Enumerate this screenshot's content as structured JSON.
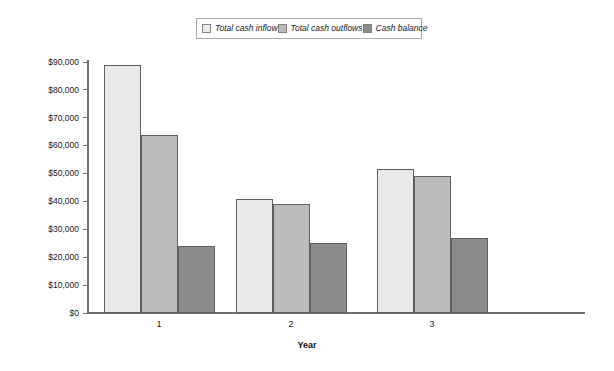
{
  "chart_data": {
    "type": "bar",
    "title": "",
    "subtitle": "",
    "xlabel": "Year",
    "ylabel": "",
    "categories": [
      "1",
      "2",
      "3"
    ],
    "series": [
      {
        "name": "Total cash inflow",
        "color": "#e9e9e9",
        "values": [
          89000,
          41000,
          51500
        ]
      },
      {
        "name": "Total cash outflows",
        "color": "#bcbcbc",
        "values": [
          64000,
          39000,
          49000
        ]
      },
      {
        "name": "Cash balance",
        "color": "#8c8c8c",
        "values": [
          24000,
          25000,
          27000
        ]
      }
    ],
    "ylim": [
      0,
      90000
    ],
    "ytick_values": [
      0,
      10000,
      20000,
      30000,
      40000,
      50000,
      60000,
      70000,
      80000,
      90000
    ],
    "ytick_labels": [
      "$0",
      "$10,000",
      "$20,000",
      "$30,000",
      "$40,000",
      "$50,000",
      "$60,000",
      "$70,000",
      "$80,000",
      "$90,000"
    ],
    "grid": false,
    "legend_position": "top-center",
    "axis_color": "#6e6e6e",
    "bar_border_color": "#5e5e5e",
    "background_color": "#ffffff"
  },
  "legend": {
    "entries": [
      {
        "label": "Total cash inflow"
      },
      {
        "label": "Total cash outflows"
      },
      {
        "label": "Cash balance"
      }
    ]
  },
  "axes": {
    "x_title": "Year",
    "x_labels": [
      "1",
      "2",
      "3"
    ],
    "y_labels": [
      "$90,000",
      "$80,000",
      "$70,000",
      "$60,000",
      "$50,000",
      "$40,000",
      "$30,000",
      "$20,000",
      "$10,000",
      "$0"
    ]
  }
}
